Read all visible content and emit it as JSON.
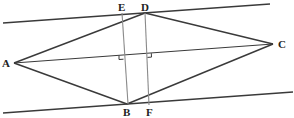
{
  "diagram": {
    "type": "geometry",
    "colors": {
      "stroke_dark": "#3a3a3a",
      "stroke_light": "#8a8a8a",
      "label": "#222222",
      "background": "#ffffff"
    },
    "points": {
      "A": {
        "label": "A",
        "x": 14,
        "y": 63
      },
      "B": {
        "label": "B",
        "x": 127,
        "y": 104
      },
      "C": {
        "label": "C",
        "x": 273,
        "y": 44
      },
      "D": {
        "label": "D",
        "x": 145,
        "y": 13
      },
      "E": {
        "label": "E",
        "x": 122,
        "y": 13
      },
      "F": {
        "label": "F",
        "x": 149,
        "y": 105
      }
    },
    "lines": {
      "top_parallel": {
        "x1": 3,
        "y1": 23,
        "x2": 270,
        "y2": 4
      },
      "bottom_parallel": {
        "x1": 3,
        "y1": 113,
        "x2": 293,
        "y2": 92
      }
    },
    "labels": [
      "A",
      "B",
      "C",
      "D",
      "E",
      "F"
    ]
  }
}
